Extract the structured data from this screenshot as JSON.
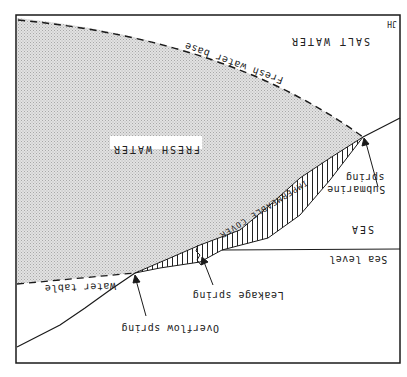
{
  "diagram": {
    "orientation": "rotated 180 degrees (upside down)",
    "corner_mark": "JH",
    "regions": {
      "salt_water": "SALT WATER",
      "fresh_water": "FRESH WATER",
      "sea": "SEA",
      "impermeable_cover": "IMPERMEABLE COVER"
    },
    "lines": {
      "fresh_water_base": "Fresh water base",
      "water_table": "Water table",
      "sea_level": "Sea level"
    },
    "springs": {
      "overflow": "Overflow spring",
      "leakage": "Leakage spring",
      "submarine_line1": "Submarine",
      "submarine_line2": "spring"
    },
    "colors": {
      "fresh_water_fill": "#d9d9d9",
      "line": "#1a1a1a",
      "background": "#ffffff"
    }
  }
}
